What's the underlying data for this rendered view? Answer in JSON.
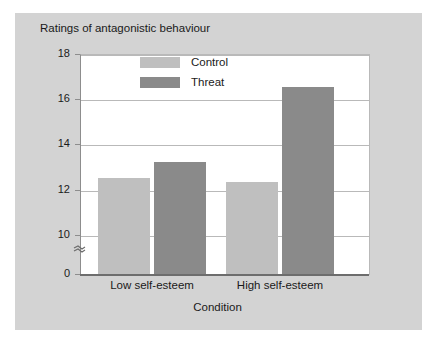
{
  "chart_data": {
    "type": "bar",
    "title": "Ratings of antagonistic behaviour",
    "xlabel": "Condition",
    "ylabel": "",
    "categories": [
      "Low self-esteem",
      "High self-esteem"
    ],
    "series": [
      {
        "name": "Control",
        "color": "#bfbfbf",
        "values": [
          12.5,
          12.35
        ]
      },
      {
        "name": "Threat",
        "color": "#8a8a8a",
        "values": [
          13.2,
          16.55
        ]
      }
    ],
    "ylim": [
      0,
      18
    ],
    "yticks": [
      18,
      16,
      14,
      12,
      10,
      0
    ],
    "ytick_labels": [
      "18",
      "16",
      "14",
      "12",
      "10",
      "0"
    ],
    "axis_break": true,
    "axis_break_between": [
      0,
      10
    ],
    "grid": true,
    "legend_position": "top-center",
    "background_color": "#d3d3d3",
    "plot_background_color": "#ffffff",
    "gridline_color": "#b9b9b9"
  },
  "legend": {
    "items": [
      {
        "label": "Control"
      },
      {
        "label": "Threat"
      }
    ]
  },
  "icons": {
    "axis_break": "axis-break-squiggle"
  }
}
